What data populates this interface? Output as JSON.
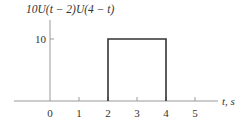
{
  "chart_data": {
    "type": "line",
    "title": "10U(t − 2)U(4 − t)",
    "xlabel": "t, s",
    "ylabel": "10U(t − 2)U(4 − t)",
    "xlim": [
      -1.25,
      5.8
    ],
    "ylim": [
      0,
      14
    ],
    "x_ticks": [
      0,
      1,
      2,
      3,
      4,
      5
    ],
    "x_tick_labels": [
      "0",
      "1",
      "2",
      "3",
      "4",
      "5"
    ],
    "y_ticks": [
      10
    ],
    "y_tick_labels": [
      "10"
    ],
    "grid": false,
    "series": [
      {
        "name": "10U(t − 2)U(4 − t)",
        "x": [
          2,
          2,
          4,
          4
        ],
        "y": [
          0,
          10,
          10,
          0
        ]
      }
    ]
  }
}
